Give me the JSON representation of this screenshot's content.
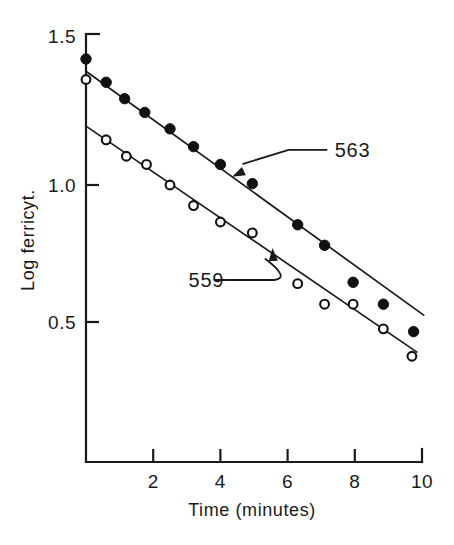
{
  "chart_data": {
    "type": "scatter",
    "title": "",
    "xlabel": "Time (minutes)",
    "ylabel": "Log ferricyt.",
    "xlim": [
      0,
      10.3
    ],
    "ylim": [
      0.28,
      1.56
    ],
    "grid": false,
    "legend_position": "inline-annotations",
    "xticks": [
      2,
      4,
      6,
      8,
      10
    ],
    "xtick_labels": [
      "2",
      "4",
      "6",
      "8",
      "10"
    ],
    "yticks": [
      0.5,
      1.0,
      1.5
    ],
    "ytick_labels": [
      "0.5",
      "1.0",
      "1.5"
    ],
    "annotations": [
      {
        "label": "563",
        "text_x": 7.4,
        "text_y": 1.11,
        "points_to_x": 4.35,
        "points_to_y": 1.03,
        "series": "563"
      },
      {
        "label": "559",
        "text_x": 3.05,
        "text_y": 0.635,
        "points_to_x": 5.55,
        "points_to_y": 0.77,
        "series": "559"
      }
    ],
    "series": [
      {
        "name": "563",
        "marker": "filled-circle",
        "color": "#111111",
        "marker_size": 5.2,
        "fit_line": {
          "x_start": 0.0,
          "y_start": 1.415,
          "x_end": 10.05,
          "y_end": 0.525
        },
        "points": [
          {
            "x": 0.0,
            "y": 1.46
          },
          {
            "x": 0.6,
            "y": 1.375
          },
          {
            "x": 1.15,
            "y": 1.315
          },
          {
            "x": 1.75,
            "y": 1.265
          },
          {
            "x": 2.5,
            "y": 1.205
          },
          {
            "x": 3.2,
            "y": 1.14
          },
          {
            "x": 4.0,
            "y": 1.075
          },
          {
            "x": 4.95,
            "y": 1.005
          },
          {
            "x": 6.3,
            "y": 0.855
          },
          {
            "x": 7.1,
            "y": 0.78
          },
          {
            "x": 7.95,
            "y": 0.645
          },
          {
            "x": 8.85,
            "y": 0.565
          },
          {
            "x": 9.75,
            "y": 0.465
          }
        ]
      },
      {
        "name": "559",
        "marker": "open-circle",
        "color": "#111111",
        "marker_size": 4.4,
        "fit_line": {
          "x_start": 0.0,
          "y_start": 1.215,
          "x_end": 9.85,
          "y_end": 0.39
        },
        "points": [
          {
            "x": 0.0,
            "y": 1.385
          },
          {
            "x": 0.6,
            "y": 1.165
          },
          {
            "x": 1.2,
            "y": 1.105
          },
          {
            "x": 1.8,
            "y": 1.075
          },
          {
            "x": 2.5,
            "y": 1.0
          },
          {
            "x": 3.2,
            "y": 0.925
          },
          {
            "x": 4.0,
            "y": 0.865
          },
          {
            "x": 4.95,
            "y": 0.825
          },
          {
            "x": 6.3,
            "y": 0.64
          },
          {
            "x": 7.1,
            "y": 0.565
          },
          {
            "x": 7.95,
            "y": 0.565
          },
          {
            "x": 8.85,
            "y": 0.475
          },
          {
            "x": 9.7,
            "y": 0.375
          }
        ]
      }
    ]
  }
}
